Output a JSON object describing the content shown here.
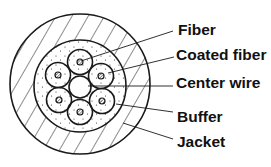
{
  "diagram": {
    "type": "cable-cross-section",
    "colors": {
      "line": "#1a1a1a",
      "background": "#ffffff",
      "text": "#111111"
    },
    "labels": [
      {
        "id": "fiber",
        "text": "Fiber"
      },
      {
        "id": "coated-fiber",
        "text": "Coated fiber"
      },
      {
        "id": "center-wire",
        "text": "Center wire"
      },
      {
        "id": "buffer",
        "text": "Buffer"
      },
      {
        "id": "jacket",
        "text": "Jacket"
      }
    ],
    "fiber_count": 6
  }
}
